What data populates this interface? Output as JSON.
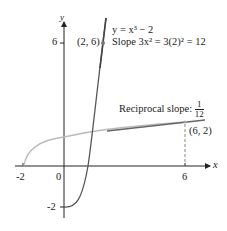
{
  "figure": {
    "axes": {
      "x_label": "x",
      "y_label": "y",
      "x_ticks": [
        "-2",
        "0",
        "6"
      ],
      "y_ticks": [
        "6",
        "-2"
      ]
    },
    "curve_label": "y = x³ − 2",
    "point_a": "(2, 6)",
    "slope_label": "Slope 3x² = 3(2)² = 12",
    "reciprocal_label": "Reciprocal slope:",
    "reciprocal_num": "1",
    "reciprocal_den": "12",
    "point_b": "(6, 2)",
    "colors": {
      "cubic": "#555555",
      "inverse": "#bbbbbb",
      "tangent": "#666666",
      "axis": "#222222"
    }
  }
}
